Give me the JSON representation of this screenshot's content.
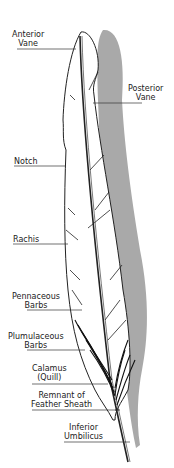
{
  "diagram": {
    "labels": {
      "anterior_vane": [
        "Anterior",
        "Vane"
      ],
      "posterior_vane": [
        "Posterior",
        "Vane"
      ],
      "notch": "Notch",
      "rachis": "Rachis",
      "pennaceous_barbs": [
        "Pennaceous",
        "Barbs"
      ],
      "plumulaceous_barbs": [
        "Plumulaceous",
        "Barbs"
      ],
      "calamus": [
        "Calamus",
        "(Quill)"
      ],
      "remnant_sheath": [
        "Remnant of",
        "Feather Sheath"
      ],
      "inferior_umbilicus": [
        "Inferior",
        "Umbilicus"
      ]
    },
    "colors": {
      "shadow": "#a9a9a9",
      "outline": "#222222",
      "fill": "#ffffff"
    }
  }
}
